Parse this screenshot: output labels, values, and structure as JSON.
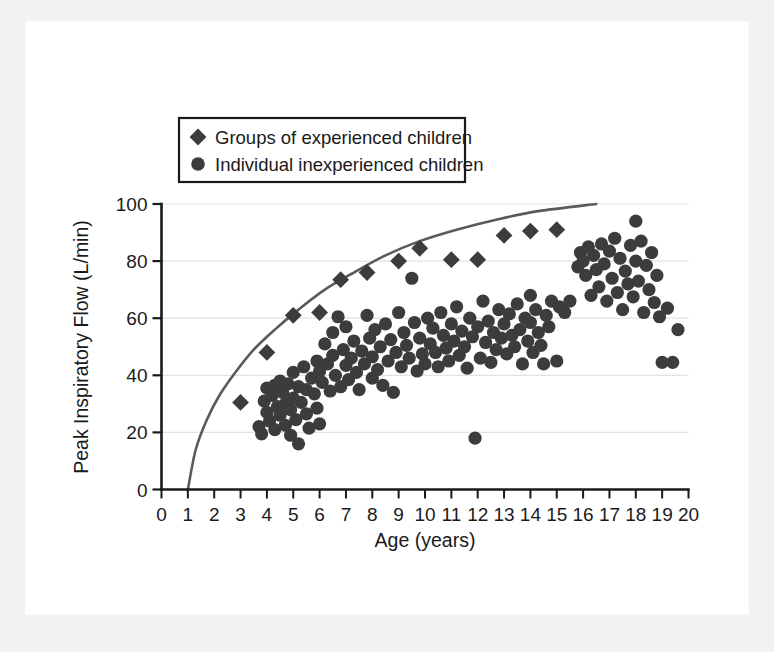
{
  "figure": {
    "background_color": "#ffffff",
    "page_margin_color": "#f2f2f2",
    "marker_color": "#3c3c3c",
    "curve_color": "#5a5a5a",
    "grid_color": "#e2e2e2",
    "axis_color": "#1a1a1a"
  },
  "legend": {
    "position": "top-left-inside",
    "entries": [
      {
        "marker": "diamond",
        "label": "Groups of experienced children"
      },
      {
        "marker": "circle",
        "label": "Individual inexperienced children"
      }
    ]
  },
  "axes": {
    "x": {
      "title": "Age (years)",
      "min": 0,
      "max": 20,
      "ticks": [
        0,
        1,
        2,
        3,
        4,
        5,
        6,
        7,
        8,
        9,
        10,
        11,
        12,
        13,
        14,
        15,
        16,
        17,
        18,
        19,
        20
      ],
      "tick_labels": [
        "0",
        "1",
        "2",
        "3",
        "4",
        "5",
        "6",
        "7",
        "8",
        "9",
        "10",
        "11",
        "12",
        "13",
        "14",
        "15",
        "16",
        "17",
        "18",
        "19",
        "20"
      ]
    },
    "y": {
      "title": "Peak Inspiratory Flow (L/min)",
      "min": 0,
      "max": 100,
      "ticks": [
        0,
        20,
        40,
        60,
        80,
        100
      ],
      "tick_labels": [
        "0",
        "20",
        "40",
        "60",
        "80",
        "100"
      ]
    }
  },
  "chart_data": {
    "type": "scatter",
    "title": "",
    "xlabel": "Age (years)",
    "ylabel": "Peak Inspiratory Flow (L/min)",
    "xlim": [
      0,
      20
    ],
    "ylim": [
      0,
      100
    ],
    "grid": "horizontal",
    "legend_position": "upper left",
    "series": [
      {
        "name": "Groups of experienced children",
        "marker": "diamond",
        "color": "#3c3c3c",
        "points": [
          [
            3.0,
            30.5
          ],
          [
            4.0,
            48.0
          ],
          [
            5.0,
            61.0
          ],
          [
            6.0,
            62.0
          ],
          [
            6.8,
            73.5
          ],
          [
            7.8,
            76.0
          ],
          [
            9.0,
            80.0
          ],
          [
            9.8,
            84.5
          ],
          [
            11.0,
            80.5
          ],
          [
            12.0,
            80.5
          ],
          [
            13.0,
            89.0
          ],
          [
            14.0,
            90.5
          ],
          [
            15.0,
            91.0
          ]
        ]
      },
      {
        "name": "Individual inexperienced children",
        "marker": "circle",
        "color": "#3c3c3c",
        "points": [
          [
            3.7,
            22.0
          ],
          [
            3.8,
            19.5
          ],
          [
            3.9,
            31.0
          ],
          [
            4.0,
            35.5
          ],
          [
            4.0,
            27.0
          ],
          [
            4.1,
            24.0
          ],
          [
            4.2,
            33.0
          ],
          [
            4.3,
            36.5
          ],
          [
            4.3,
            21.0
          ],
          [
            4.4,
            29.0
          ],
          [
            4.5,
            38.0
          ],
          [
            4.5,
            26.0
          ],
          [
            4.6,
            34.0
          ],
          [
            4.7,
            30.0
          ],
          [
            4.7,
            22.5
          ],
          [
            4.8,
            37.0
          ],
          [
            4.9,
            28.0
          ],
          [
            4.9,
            19.0
          ],
          [
            5.0,
            32.0
          ],
          [
            5.0,
            41.0
          ],
          [
            5.1,
            24.5
          ],
          [
            5.2,
            36.0
          ],
          [
            5.2,
            16.0
          ],
          [
            5.3,
            30.5
          ],
          [
            5.4,
            43.0
          ],
          [
            5.5,
            26.5
          ],
          [
            5.5,
            35.0
          ],
          [
            5.6,
            21.5
          ],
          [
            5.7,
            39.0
          ],
          [
            5.8,
            33.5
          ],
          [
            5.9,
            45.0
          ],
          [
            5.9,
            28.5
          ],
          [
            6.0,
            41.5
          ],
          [
            6.0,
            23.0
          ],
          [
            6.1,
            37.5
          ],
          [
            6.2,
            51.0
          ],
          [
            6.3,
            44.0
          ],
          [
            6.4,
            34.5
          ],
          [
            6.5,
            47.0
          ],
          [
            6.5,
            55.0
          ],
          [
            6.6,
            40.0
          ],
          [
            6.7,
            60.5
          ],
          [
            6.8,
            36.0
          ],
          [
            6.9,
            49.0
          ],
          [
            7.0,
            43.5
          ],
          [
            7.0,
            57.0
          ],
          [
            7.1,
            38.5
          ],
          [
            7.2,
            46.0
          ],
          [
            7.3,
            52.0
          ],
          [
            7.4,
            41.0
          ],
          [
            7.5,
            35.0
          ],
          [
            7.6,
            48.5
          ],
          [
            7.7,
            44.0
          ],
          [
            7.8,
            61.0
          ],
          [
            7.9,
            53.0
          ],
          [
            8.0,
            39.0
          ],
          [
            8.0,
            46.5
          ],
          [
            8.1,
            56.0
          ],
          [
            8.2,
            42.0
          ],
          [
            8.3,
            50.0
          ],
          [
            8.4,
            36.5
          ],
          [
            8.5,
            58.0
          ],
          [
            8.6,
            45.0
          ],
          [
            8.7,
            52.5
          ],
          [
            8.8,
            34.0
          ],
          [
            8.9,
            48.0
          ],
          [
            9.0,
            62.0
          ],
          [
            9.1,
            43.0
          ],
          [
            9.2,
            55.0
          ],
          [
            9.3,
            50.5
          ],
          [
            9.4,
            46.0
          ],
          [
            9.5,
            74.0
          ],
          [
            9.6,
            58.5
          ],
          [
            9.7,
            41.5
          ],
          [
            9.8,
            53.0
          ],
          [
            9.9,
            47.5
          ],
          [
            10.0,
            44.0
          ],
          [
            10.1,
            60.0
          ],
          [
            10.2,
            51.0
          ],
          [
            10.3,
            56.5
          ],
          [
            10.4,
            48.0
          ],
          [
            10.5,
            43.0
          ],
          [
            10.6,
            62.0
          ],
          [
            10.7,
            54.0
          ],
          [
            10.8,
            49.5
          ],
          [
            10.9,
            45.0
          ],
          [
            11.0,
            58.0
          ],
          [
            11.1,
            52.0
          ],
          [
            11.2,
            64.0
          ],
          [
            11.3,
            47.0
          ],
          [
            11.4,
            55.5
          ],
          [
            11.5,
            50.0
          ],
          [
            11.6,
            42.5
          ],
          [
            11.7,
            60.0
          ],
          [
            11.8,
            53.5
          ],
          [
            11.9,
            18.0
          ],
          [
            12.0,
            57.0
          ],
          [
            12.1,
            46.0
          ],
          [
            12.2,
            66.0
          ],
          [
            12.3,
            51.5
          ],
          [
            12.4,
            59.0
          ],
          [
            12.5,
            44.5
          ],
          [
            12.6,
            55.0
          ],
          [
            12.7,
            49.0
          ],
          [
            12.8,
            63.0
          ],
          [
            12.9,
            53.0
          ],
          [
            13.0,
            58.0
          ],
          [
            13.1,
            47.5
          ],
          [
            13.2,
            61.5
          ],
          [
            13.3,
            54.0
          ],
          [
            13.4,
            50.0
          ],
          [
            13.5,
            65.0
          ],
          [
            13.6,
            56.0
          ],
          [
            13.7,
            44.0
          ],
          [
            13.8,
            60.0
          ],
          [
            13.9,
            52.0
          ],
          [
            14.0,
            68.0
          ],
          [
            14.0,
            58.5
          ],
          [
            14.1,
            48.0
          ],
          [
            14.2,
            63.0
          ],
          [
            14.3,
            55.0
          ],
          [
            14.4,
            50.5
          ],
          [
            14.5,
            44.0
          ],
          [
            14.6,
            61.0
          ],
          [
            14.7,
            57.0
          ],
          [
            14.8,
            66.0
          ],
          [
            15.0,
            45.0
          ],
          [
            15.1,
            64.0
          ],
          [
            15.3,
            62.0
          ],
          [
            15.5,
            66.0
          ],
          [
            15.8,
            78.0
          ],
          [
            15.9,
            83.0
          ],
          [
            16.0,
            80.0
          ],
          [
            16.1,
            75.0
          ],
          [
            16.2,
            85.0
          ],
          [
            16.3,
            68.0
          ],
          [
            16.4,
            82.0
          ],
          [
            16.5,
            77.0
          ],
          [
            16.6,
            71.0
          ],
          [
            16.7,
            86.0
          ],
          [
            16.8,
            79.0
          ],
          [
            16.9,
            66.0
          ],
          [
            17.0,
            83.5
          ],
          [
            17.1,
            74.0
          ],
          [
            17.2,
            88.0
          ],
          [
            17.3,
            69.0
          ],
          [
            17.4,
            81.0
          ],
          [
            17.5,
            63.0
          ],
          [
            17.6,
            76.5
          ],
          [
            17.7,
            72.0
          ],
          [
            17.8,
            85.5
          ],
          [
            17.9,
            67.5
          ],
          [
            18.0,
            94.0
          ],
          [
            18.0,
            80.0
          ],
          [
            18.1,
            73.0
          ],
          [
            18.2,
            87.0
          ],
          [
            18.3,
            62.0
          ],
          [
            18.4,
            78.5
          ],
          [
            18.5,
            70.0
          ],
          [
            18.6,
            83.0
          ],
          [
            18.7,
            65.5
          ],
          [
            18.8,
            75.0
          ],
          [
            18.9,
            60.5
          ],
          [
            19.0,
            44.5
          ],
          [
            19.2,
            63.5
          ],
          [
            19.4,
            44.5
          ],
          [
            19.6,
            56.0
          ]
        ]
      }
    ],
    "annotations": [
      {
        "type": "reference_curve",
        "description": "upper boundary curve rising from age 1 at 0 L/min to about age 16.5 at 100 L/min",
        "points": [
          [
            1.0,
            0
          ],
          [
            1.3,
            14
          ],
          [
            1.7,
            24
          ],
          [
            2.2,
            33
          ],
          [
            2.8,
            41
          ],
          [
            3.5,
            49
          ],
          [
            4.3,
            56
          ],
          [
            5.2,
            63
          ],
          [
            6.2,
            70
          ],
          [
            7.3,
            76
          ],
          [
            8.5,
            82
          ],
          [
            9.8,
            87
          ],
          [
            11.2,
            91
          ],
          [
            12.7,
            94.5
          ],
          [
            14.3,
            97.5
          ],
          [
            16.5,
            100
          ]
        ]
      }
    ]
  }
}
